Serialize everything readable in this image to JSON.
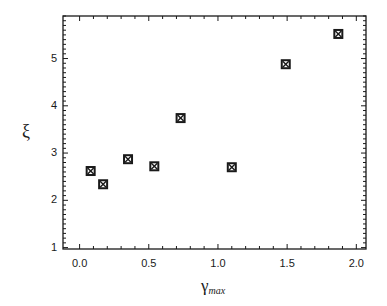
{
  "chart_data": {
    "type": "scatter",
    "title": "",
    "xlabel": "γ_max",
    "xlabel_main": "γ",
    "xlabel_sub": "max",
    "ylabel": "ξ",
    "xlim": [
      -0.12,
      2.07
    ],
    "ylim": [
      0.97,
      5.9
    ],
    "x_ticks": [
      0.0,
      0.5,
      1.0,
      1.5,
      2.0
    ],
    "x_tick_labels": [
      "0.0",
      "0.5",
      "1.0",
      "1.5",
      "2.0"
    ],
    "y_ticks": [
      1,
      2,
      3,
      4,
      5
    ],
    "y_tick_labels": [
      "1",
      "2",
      "3",
      "4",
      "5"
    ],
    "grid": false,
    "legend": null,
    "marker": "square-with-x",
    "series": [
      {
        "name": "ξ vs γ_max",
        "x": [
          0.08,
          0.17,
          0.35,
          0.54,
          0.73,
          1.1,
          1.49,
          1.87
        ],
        "y": [
          2.62,
          2.34,
          2.87,
          2.72,
          3.74,
          2.7,
          4.88,
          5.52
        ]
      }
    ]
  },
  "colors": {
    "axis": "#1a1a1a",
    "marker": "#1a1a1a",
    "background": "#ffffff"
  }
}
